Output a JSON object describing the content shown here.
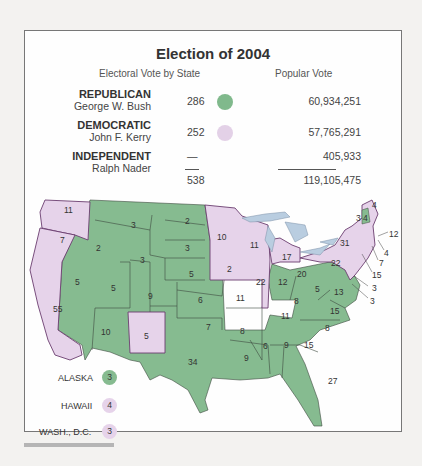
{
  "title": "Election of 2004",
  "headers": {
    "electoral": "Electoral Vote by State",
    "popular": "Popular Vote"
  },
  "parties": [
    {
      "party": "REPUBLICAN",
      "candidate": "George W. Bush",
      "electoral": "286",
      "popular": "60,934,251",
      "color": "#7fb98a"
    },
    {
      "party": "DEMOCRATIC",
      "candidate": "John F. Kerry",
      "electoral": "252",
      "popular": "57,765,291",
      "color": "#e2cde6"
    },
    {
      "party": "INDEPENDENT",
      "candidate": "Ralph Nader",
      "electoral": "—",
      "popular": "405,933",
      "color": ""
    }
  ],
  "totals": {
    "electoral": "538",
    "popular": "119,105,475"
  },
  "colors": {
    "republican": "#86bb90",
    "democratic": "#e6d3ea",
    "water": "#b9cde0",
    "border": "#3d4a3f",
    "dem_border": "#6b3d6f"
  },
  "map_labels": [
    {
      "state": "WA",
      "ev": "11"
    },
    {
      "state": "OR",
      "ev": "7"
    },
    {
      "state": "CA",
      "ev": "55"
    },
    {
      "state": "ID",
      "ev": "2"
    },
    {
      "state": "NV",
      "ev": "5"
    },
    {
      "state": "MT",
      "ev": "3"
    },
    {
      "state": "WY",
      "ev": "3"
    },
    {
      "state": "UT",
      "ev": "5"
    },
    {
      "state": "AZ",
      "ev": "10"
    },
    {
      "state": "CO",
      "ev": "9"
    },
    {
      "state": "NM",
      "ev": "5"
    },
    {
      "state": "ND",
      "ev": "2"
    },
    {
      "state": "SD",
      "ev": "3"
    },
    {
      "state": "NE",
      "ev": "5"
    },
    {
      "state": "KS",
      "ev": "6"
    },
    {
      "state": "OK",
      "ev": "7"
    },
    {
      "state": "TX",
      "ev": "34"
    },
    {
      "state": "MN",
      "ev": "10"
    },
    {
      "state": "IA",
      "ev": "2"
    },
    {
      "state": "MO",
      "ev": "11"
    },
    {
      "state": "AR",
      "ev": "8"
    },
    {
      "state": "LA",
      "ev": "9"
    },
    {
      "state": "WI",
      "ev": "11"
    },
    {
      "state": "IL",
      "ev": "22"
    },
    {
      "state": "MI",
      "ev": "17"
    },
    {
      "state": "IN",
      "ev": "12"
    },
    {
      "state": "OH",
      "ev": "20"
    },
    {
      "state": "KY",
      "ev": "8"
    },
    {
      "state": "TN",
      "ev": "11"
    },
    {
      "state": "MS",
      "ev": "6"
    },
    {
      "state": "AL",
      "ev": "9"
    },
    {
      "state": "GA",
      "ev": "15"
    },
    {
      "state": "FL",
      "ev": "27"
    },
    {
      "state": "SC",
      "ev": "8"
    },
    {
      "state": "NC",
      "ev": "15"
    },
    {
      "state": "VA",
      "ev": "13"
    },
    {
      "state": "WV",
      "ev": "5"
    },
    {
      "state": "PA",
      "ev": "22"
    },
    {
      "state": "NY",
      "ev": "31"
    },
    {
      "state": "VT",
      "ev": "3"
    },
    {
      "state": "NH",
      "ev": "4"
    },
    {
      "state": "ME",
      "ev": "4"
    },
    {
      "state": "MA",
      "ev": "12"
    },
    {
      "state": "RI",
      "ev": "4"
    },
    {
      "state": "CT",
      "ev": "7"
    },
    {
      "state": "NJ",
      "ev": "15"
    },
    {
      "state": "DE",
      "ev": "3"
    },
    {
      "state": "MD",
      "ev": "3"
    }
  ],
  "extras": [
    {
      "label": "ALASKA",
      "ev": "3",
      "winner": "republican"
    },
    {
      "label": "HAWAII",
      "ev": "4",
      "winner": "democratic"
    },
    {
      "label": "WASH., D.C.",
      "ev": "3",
      "winner": "democratic"
    }
  ]
}
